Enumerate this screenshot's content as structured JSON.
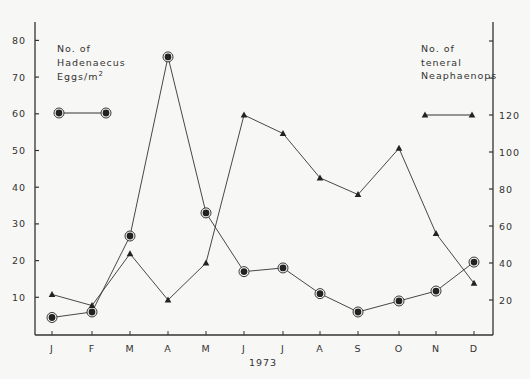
{
  "chart_data": {
    "type": "line",
    "title": "",
    "xlabel": "1973",
    "categories": [
      "J",
      "F",
      "M",
      "A",
      "M",
      "J",
      "J",
      "A",
      "S",
      "O",
      "N",
      "D"
    ],
    "y_left": {
      "label": "No. of Hadenaecus Eggs/m²",
      "ticks": [
        10,
        20,
        30,
        40,
        50,
        60,
        70,
        80
      ],
      "ylim": [
        0,
        85
      ]
    },
    "y_right": {
      "label": "No. of teneral Neaphaenops",
      "ticks": [
        20,
        40,
        60,
        80,
        100,
        120
      ],
      "ylim": [
        0,
        170
      ]
    },
    "series": [
      {
        "name": "No. of Hadenaecus Eggs/m²",
        "axis": "left",
        "marker": "circle",
        "values": [
          4.5,
          6,
          26.7,
          75.5,
          33,
          17,
          18,
          11,
          6,
          9,
          11.7,
          19.6
        ]
      },
      {
        "name": "No. of teneral Neaphaenops",
        "axis": "right",
        "marker": "triangle",
        "values": [
          23,
          17,
          45,
          20,
          40,
          120,
          110,
          86,
          77,
          102,
          56,
          29
        ]
      }
    ],
    "grid": false,
    "legend_position": "top-left and top-right (inline labels)"
  },
  "legend": {
    "left": {
      "line1": "No. of",
      "line2": "Hadenaecus",
      "line3": "Eggs/m",
      "sup": "2"
    },
    "right": {
      "line1": "No. of",
      "line2": "teneral",
      "line3": "Neaphaenops"
    }
  }
}
